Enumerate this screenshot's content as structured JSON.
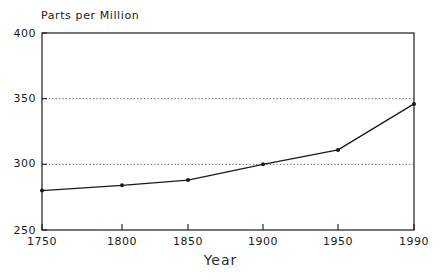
{
  "chart_data": {
    "type": "line",
    "title": "",
    "xlabel": "Year",
    "ylabel": "Parts per Million",
    "x": [
      1750,
      1800,
      1850,
      1900,
      1950,
      1990
    ],
    "values": [
      280,
      284,
      288,
      300,
      311,
      346
    ],
    "series": [
      {
        "name": "Parts per Million",
        "values": [
          280,
          284,
          288,
          300,
          311,
          346
        ]
      }
    ],
    "xlim": [
      1750,
      1990
    ],
    "ylim": [
      250,
      400
    ],
    "xticks": [
      1750,
      1800,
      1850,
      1900,
      1950,
      1990
    ],
    "xticklabels": [
      "1750",
      "1800",
      "1850",
      "1900",
      "1950",
      "1990"
    ],
    "yticks": [
      250,
      300,
      350,
      400
    ],
    "yticklabels": [
      "250",
      "300",
      "350",
      "400"
    ],
    "gridlines": [
      300,
      350
    ],
    "grid": true,
    "grid_style": "dotted",
    "legend": "none",
    "marker": "dot",
    "line_color": "#1a1a1a",
    "grid_color": "#4d4d4d",
    "axis_color": "#1a1a1a",
    "background": "#ffffff"
  },
  "axes": {
    "y_title": "Parts per Million",
    "x_title": "Year"
  }
}
